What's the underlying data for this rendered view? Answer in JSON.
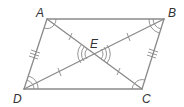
{
  "diagram": {
    "type": "parallelogram-with-diagonals",
    "colors": {
      "line": "#8a8a8a",
      "label": "#333333",
      "background": "#ffffff"
    },
    "points": {
      "A": {
        "label": "A",
        "x": 47,
        "y": 19
      },
      "B": {
        "label": "B",
        "x": 164,
        "y": 19
      },
      "C": {
        "label": "C",
        "x": 142,
        "y": 89
      },
      "D": {
        "label": "D",
        "x": 24,
        "y": 89
      },
      "E": {
        "label": "E",
        "x": 94,
        "y": 54
      }
    },
    "segments": [
      "AB",
      "BC",
      "CD",
      "DA",
      "AC",
      "BD"
    ],
    "tick_marks": [
      {
        "segment": "AD",
        "count": 3
      },
      {
        "segment": "BC",
        "count": 3
      },
      {
        "segment": "AE",
        "count": 1
      },
      {
        "segment": "EC",
        "count": 1
      },
      {
        "segment": "BE",
        "count": 1
      },
      {
        "segment": "ED",
        "count": 1
      }
    ],
    "angle_marks": [
      {
        "vertex": "A",
        "count": 1
      },
      {
        "vertex": "B",
        "count": 2
      },
      {
        "vertex": "C",
        "count": 1
      },
      {
        "vertex": "D",
        "count": 2
      },
      {
        "vertex": "E-left",
        "count": 3
      },
      {
        "vertex": "E-right",
        "count": 3
      }
    ]
  }
}
